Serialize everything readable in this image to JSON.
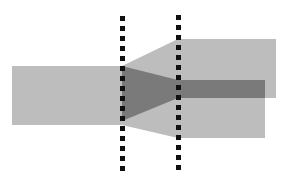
{
  "diagram": {
    "colors": {
      "background": "#ffffff",
      "band_light": "#bdbdbd",
      "band_dark": "#7a7a7a",
      "boundary": "#111111"
    },
    "elements": [
      {
        "id": "incoming-band",
        "role": "input flow"
      },
      {
        "id": "upper-outgoing-band",
        "role": "output flow (upper)"
      },
      {
        "id": "lower-outgoing-band",
        "role": "output flow (lower)"
      },
      {
        "id": "highlighted-subflow",
        "role": "dark sub-flow passing through"
      },
      {
        "id": "left-boundary",
        "role": "dashed boundary"
      },
      {
        "id": "right-boundary",
        "role": "dashed boundary"
      }
    ]
  }
}
